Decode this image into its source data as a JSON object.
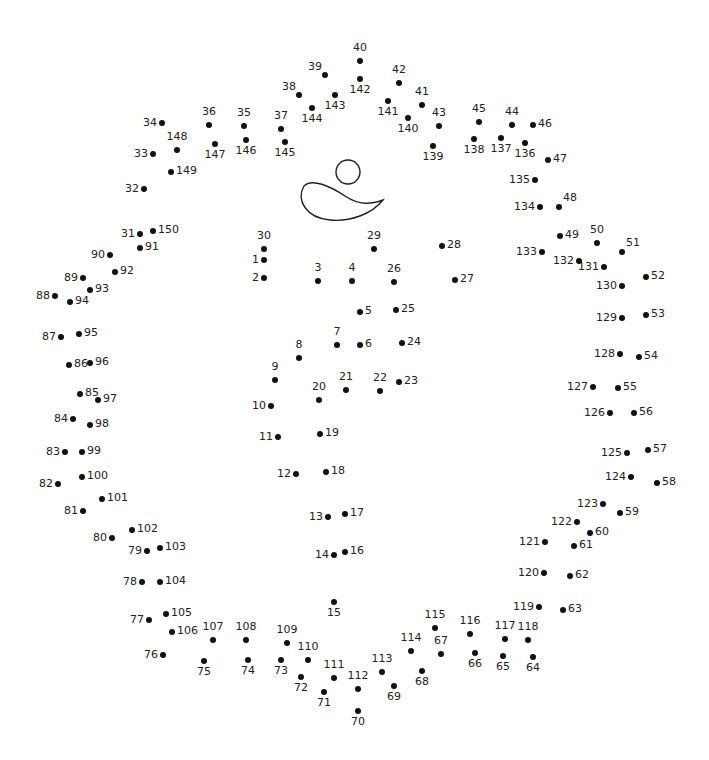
{
  "puzzle": {
    "type": "connect-the-dots",
    "total_dots": 150,
    "colors": {
      "dot": "#111111",
      "label": "#222222",
      "outline": "#222222",
      "background": "#ffffff"
    },
    "drawn_shapes": [
      {
        "name": "circle-head",
        "cx": 348,
        "cy": 172,
        "r": 12
      },
      {
        "name": "swoosh-body",
        "path": "M304,186 C312,178 330,186 345,196 C360,206 372,204 383,200 C372,214 350,222 330,220 C306,218 296,200 304,186 Z"
      }
    ],
    "dots": [
      {
        "n": 1,
        "x": 264,
        "y": 260,
        "pos": "l"
      },
      {
        "n": 2,
        "x": 264,
        "y": 278,
        "pos": "l"
      },
      {
        "n": 3,
        "x": 318,
        "y": 281,
        "pos": "t"
      },
      {
        "n": 4,
        "x": 352,
        "y": 281,
        "pos": "t"
      },
      {
        "n": 5,
        "x": 360,
        "y": 312,
        "pos": "r"
      },
      {
        "n": 6,
        "x": 360,
        "y": 345,
        "pos": "r"
      },
      {
        "n": 7,
        "x": 337,
        "y": 345,
        "pos": "t"
      },
      {
        "n": 8,
        "x": 299,
        "y": 358,
        "pos": "t"
      },
      {
        "n": 9,
        "x": 275,
        "y": 380,
        "pos": "t"
      },
      {
        "n": 10,
        "x": 271,
        "y": 406,
        "pos": "l"
      },
      {
        "n": 11,
        "x": 278,
        "y": 437,
        "pos": "l"
      },
      {
        "n": 12,
        "x": 296,
        "y": 474,
        "pos": "l"
      },
      {
        "n": 13,
        "x": 328,
        "y": 517,
        "pos": "l"
      },
      {
        "n": 14,
        "x": 334,
        "y": 555,
        "pos": "l"
      },
      {
        "n": 15,
        "x": 334,
        "y": 602,
        "pos": "b"
      },
      {
        "n": 16,
        "x": 345,
        "y": 552,
        "pos": "r"
      },
      {
        "n": 17,
        "x": 345,
        "y": 514,
        "pos": "r"
      },
      {
        "n": 18,
        "x": 326,
        "y": 472,
        "pos": "r"
      },
      {
        "n": 19,
        "x": 320,
        "y": 434,
        "pos": "r"
      },
      {
        "n": 20,
        "x": 319,
        "y": 400,
        "pos": "t"
      },
      {
        "n": 21,
        "x": 346,
        "y": 390,
        "pos": "t"
      },
      {
        "n": 22,
        "x": 380,
        "y": 391,
        "pos": "t"
      },
      {
        "n": 23,
        "x": 399,
        "y": 382,
        "pos": "r"
      },
      {
        "n": 24,
        "x": 402,
        "y": 343,
        "pos": "r"
      },
      {
        "n": 25,
        "x": 396,
        "y": 310,
        "pos": "r"
      },
      {
        "n": 26,
        "x": 394,
        "y": 282,
        "pos": "t"
      },
      {
        "n": 27,
        "x": 455,
        "y": 280,
        "pos": "r"
      },
      {
        "n": 28,
        "x": 442,
        "y": 246,
        "pos": "r"
      },
      {
        "n": 29,
        "x": 374,
        "y": 249,
        "pos": "t"
      },
      {
        "n": 30,
        "x": 264,
        "y": 249,
        "pos": "t"
      },
      {
        "n": 31,
        "x": 140,
        "y": 234,
        "pos": "l"
      },
      {
        "n": 32,
        "x": 144,
        "y": 189,
        "pos": "l"
      },
      {
        "n": 33,
        "x": 153,
        "y": 154,
        "pos": "l"
      },
      {
        "n": 34,
        "x": 162,
        "y": 123,
        "pos": "l"
      },
      {
        "n": 35,
        "x": 244,
        "y": 126,
        "pos": "t"
      },
      {
        "n": 36,
        "x": 209,
        "y": 125,
        "pos": "t"
      },
      {
        "n": 37,
        "x": 281,
        "y": 129,
        "pos": "t"
      },
      {
        "n": 38,
        "x": 299,
        "y": 95,
        "pos": "tl"
      },
      {
        "n": 39,
        "x": 325,
        "y": 75,
        "pos": "tl"
      },
      {
        "n": 40,
        "x": 360,
        "y": 61,
        "pos": "t"
      },
      {
        "n": 41,
        "x": 422,
        "y": 105,
        "pos": "t"
      },
      {
        "n": 42,
        "x": 399,
        "y": 83,
        "pos": "t"
      },
      {
        "n": 43,
        "x": 439,
        "y": 126,
        "pos": "t"
      },
      {
        "n": 44,
        "x": 512,
        "y": 125,
        "pos": "t"
      },
      {
        "n": 45,
        "x": 479,
        "y": 122,
        "pos": "t"
      },
      {
        "n": 46,
        "x": 533,
        "y": 125,
        "pos": "r"
      },
      {
        "n": 47,
        "x": 548,
        "y": 160,
        "pos": "r"
      },
      {
        "n": 48,
        "x": 559,
        "y": 207,
        "pos": "tr"
      },
      {
        "n": 49,
        "x": 560,
        "y": 236,
        "pos": "r"
      },
      {
        "n": 50,
        "x": 597,
        "y": 243,
        "pos": "t"
      },
      {
        "n": 51,
        "x": 622,
        "y": 252,
        "pos": "tr"
      },
      {
        "n": 52,
        "x": 646,
        "y": 277,
        "pos": "r"
      },
      {
        "n": 53,
        "x": 646,
        "y": 315,
        "pos": "r"
      },
      {
        "n": 54,
        "x": 639,
        "y": 357,
        "pos": "r"
      },
      {
        "n": 55,
        "x": 618,
        "y": 388,
        "pos": "r"
      },
      {
        "n": 56,
        "x": 634,
        "y": 413,
        "pos": "r"
      },
      {
        "n": 57,
        "x": 648,
        "y": 450,
        "pos": "r"
      },
      {
        "n": 58,
        "x": 657,
        "y": 483,
        "pos": "r"
      },
      {
        "n": 59,
        "x": 620,
        "y": 513,
        "pos": "r"
      },
      {
        "n": 60,
        "x": 590,
        "y": 533,
        "pos": "r"
      },
      {
        "n": 61,
        "x": 574,
        "y": 546,
        "pos": "r"
      },
      {
        "n": 62,
        "x": 570,
        "y": 576,
        "pos": "r"
      },
      {
        "n": 63,
        "x": 563,
        "y": 610,
        "pos": "r"
      },
      {
        "n": 64,
        "x": 533,
        "y": 657,
        "pos": "b"
      },
      {
        "n": 65,
        "x": 503,
        "y": 656,
        "pos": "b"
      },
      {
        "n": 66,
        "x": 475,
        "y": 653,
        "pos": "b"
      },
      {
        "n": 67,
        "x": 441,
        "y": 654,
        "pos": "t"
      },
      {
        "n": 68,
        "x": 422,
        "y": 671,
        "pos": "b"
      },
      {
        "n": 69,
        "x": 394,
        "y": 686,
        "pos": "b"
      },
      {
        "n": 70,
        "x": 358,
        "y": 711,
        "pos": "b"
      },
      {
        "n": 71,
        "x": 324,
        "y": 692,
        "pos": "b"
      },
      {
        "n": 72,
        "x": 301,
        "y": 677,
        "pos": "b"
      },
      {
        "n": 73,
        "x": 281,
        "y": 660,
        "pos": "b"
      },
      {
        "n": 74,
        "x": 248,
        "y": 660,
        "pos": "b"
      },
      {
        "n": 75,
        "x": 204,
        "y": 661,
        "pos": "b"
      },
      {
        "n": 76,
        "x": 163,
        "y": 655,
        "pos": "l"
      },
      {
        "n": 77,
        "x": 149,
        "y": 620,
        "pos": "l"
      },
      {
        "n": 78,
        "x": 142,
        "y": 582,
        "pos": "l"
      },
      {
        "n": 79,
        "x": 147,
        "y": 551,
        "pos": "l"
      },
      {
        "n": 80,
        "x": 112,
        "y": 538,
        "pos": "l"
      },
      {
        "n": 81,
        "x": 83,
        "y": 511,
        "pos": "l"
      },
      {
        "n": 82,
        "x": 58,
        "y": 484,
        "pos": "l"
      },
      {
        "n": 83,
        "x": 65,
        "y": 452,
        "pos": "l"
      },
      {
        "n": 84,
        "x": 73,
        "y": 419,
        "pos": "l"
      },
      {
        "n": 85,
        "x": 80,
        "y": 394,
        "pos": "r"
      },
      {
        "n": 86,
        "x": 69,
        "y": 365,
        "pos": "r"
      },
      {
        "n": 87,
        "x": 61,
        "y": 337,
        "pos": "l"
      },
      {
        "n": 88,
        "x": 55,
        "y": 296,
        "pos": "l"
      },
      {
        "n": 89,
        "x": 83,
        "y": 278,
        "pos": "l"
      },
      {
        "n": 90,
        "x": 110,
        "y": 255,
        "pos": "l"
      },
      {
        "n": 91,
        "x": 140,
        "y": 248,
        "pos": "r"
      },
      {
        "n": 92,
        "x": 115,
        "y": 272,
        "pos": "r"
      },
      {
        "n": 93,
        "x": 90,
        "y": 290,
        "pos": "r"
      },
      {
        "n": 94,
        "x": 70,
        "y": 302,
        "pos": "r"
      },
      {
        "n": 95,
        "x": 79,
        "y": 334,
        "pos": "r"
      },
      {
        "n": 96,
        "x": 90,
        "y": 363,
        "pos": "r"
      },
      {
        "n": 97,
        "x": 98,
        "y": 400,
        "pos": "r"
      },
      {
        "n": 98,
        "x": 90,
        "y": 425,
        "pos": "r"
      },
      {
        "n": 99,
        "x": 82,
        "y": 452,
        "pos": "r"
      },
      {
        "n": 100,
        "x": 82,
        "y": 477,
        "pos": "r"
      },
      {
        "n": 101,
        "x": 102,
        "y": 499,
        "pos": "r"
      },
      {
        "n": 102,
        "x": 132,
        "y": 530,
        "pos": "r"
      },
      {
        "n": 103,
        "x": 160,
        "y": 548,
        "pos": "r"
      },
      {
        "n": 104,
        "x": 160,
        "y": 582,
        "pos": "r"
      },
      {
        "n": 105,
        "x": 166,
        "y": 614,
        "pos": "r"
      },
      {
        "n": 106,
        "x": 172,
        "y": 632,
        "pos": "r"
      },
      {
        "n": 107,
        "x": 213,
        "y": 640,
        "pos": "t"
      },
      {
        "n": 108,
        "x": 246,
        "y": 640,
        "pos": "t"
      },
      {
        "n": 109,
        "x": 287,
        "y": 643,
        "pos": "t"
      },
      {
        "n": 110,
        "x": 308,
        "y": 660,
        "pos": "t"
      },
      {
        "n": 111,
        "x": 334,
        "y": 678,
        "pos": "t"
      },
      {
        "n": 112,
        "x": 358,
        "y": 689,
        "pos": "t"
      },
      {
        "n": 113,
        "x": 382,
        "y": 672,
        "pos": "t"
      },
      {
        "n": 114,
        "x": 411,
        "y": 651,
        "pos": "t"
      },
      {
        "n": 115,
        "x": 435,
        "y": 628,
        "pos": "t"
      },
      {
        "n": 116,
        "x": 470,
        "y": 634,
        "pos": "t"
      },
      {
        "n": 117,
        "x": 505,
        "y": 639,
        "pos": "t"
      },
      {
        "n": 118,
        "x": 528,
        "y": 640,
        "pos": "t"
      },
      {
        "n": 119,
        "x": 539,
        "y": 607,
        "pos": "l"
      },
      {
        "n": 120,
        "x": 544,
        "y": 573,
        "pos": "l"
      },
      {
        "n": 121,
        "x": 545,
        "y": 542,
        "pos": "l"
      },
      {
        "n": 122,
        "x": 577,
        "y": 522,
        "pos": "l"
      },
      {
        "n": 123,
        "x": 603,
        "y": 504,
        "pos": "l"
      },
      {
        "n": 124,
        "x": 631,
        "y": 477,
        "pos": "l"
      },
      {
        "n": 125,
        "x": 627,
        "y": 453,
        "pos": "l"
      },
      {
        "n": 126,
        "x": 610,
        "y": 413,
        "pos": "l"
      },
      {
        "n": 127,
        "x": 593,
        "y": 387,
        "pos": "l"
      },
      {
        "n": 128,
        "x": 620,
        "y": 354,
        "pos": "l"
      },
      {
        "n": 129,
        "x": 622,
        "y": 318,
        "pos": "l"
      },
      {
        "n": 130,
        "x": 622,
        "y": 286,
        "pos": "l"
      },
      {
        "n": 131,
        "x": 604,
        "y": 267,
        "pos": "l"
      },
      {
        "n": 132,
        "x": 579,
        "y": 261,
        "pos": "l"
      },
      {
        "n": 133,
        "x": 542,
        "y": 252,
        "pos": "l"
      },
      {
        "n": 134,
        "x": 540,
        "y": 207,
        "pos": "l"
      },
      {
        "n": 135,
        "x": 535,
        "y": 180,
        "pos": "l"
      },
      {
        "n": 136,
        "x": 525,
        "y": 143,
        "pos": "b"
      },
      {
        "n": 137,
        "x": 501,
        "y": 138,
        "pos": "b"
      },
      {
        "n": 138,
        "x": 474,
        "y": 139,
        "pos": "b"
      },
      {
        "n": 139,
        "x": 433,
        "y": 146,
        "pos": "b"
      },
      {
        "n": 140,
        "x": 408,
        "y": 118,
        "pos": "b"
      },
      {
        "n": 141,
        "x": 388,
        "y": 101,
        "pos": "b"
      },
      {
        "n": 142,
        "x": 360,
        "y": 79,
        "pos": "b"
      },
      {
        "n": 143,
        "x": 335,
        "y": 95,
        "pos": "b"
      },
      {
        "n": 144,
        "x": 312,
        "y": 108,
        "pos": "b"
      },
      {
        "n": 145,
        "x": 285,
        "y": 142,
        "pos": "b"
      },
      {
        "n": 146,
        "x": 246,
        "y": 140,
        "pos": "b"
      },
      {
        "n": 147,
        "x": 215,
        "y": 144,
        "pos": "b"
      },
      {
        "n": 148,
        "x": 177,
        "y": 150,
        "pos": "t"
      },
      {
        "n": 149,
        "x": 171,
        "y": 172,
        "pos": "r"
      },
      {
        "n": 150,
        "x": 153,
        "y": 231,
        "pos": "r"
      }
    ]
  }
}
